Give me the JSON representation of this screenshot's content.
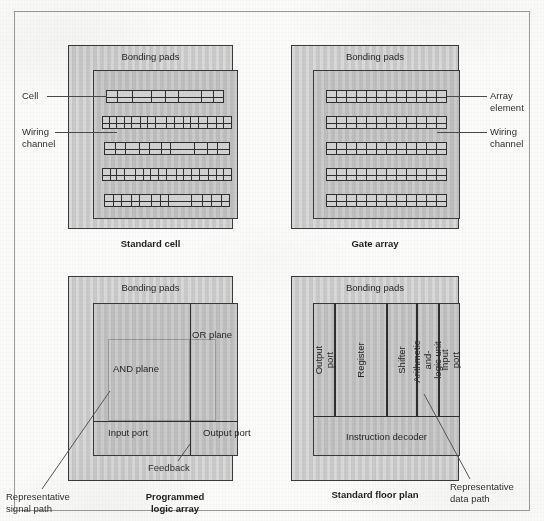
{
  "figure": {
    "panels": [
      {
        "id": "standard-cell",
        "caption": "Standard cell",
        "bonding_pads_label": "Bonding pads",
        "callouts": [
          {
            "name": "cell",
            "text": "Cell"
          },
          {
            "name": "wiring-channel",
            "text": "Wiring\nchannel"
          }
        ],
        "rows": [
          {
            "cells": [
              9,
              13,
              16,
              12,
              11,
              20,
              10,
              8
            ]
          },
          {
            "cells": [
              7,
              7,
              8,
              7,
              9,
              7,
              8,
              12,
              8,
              9,
              7,
              8,
              10,
              9,
              7,
              8
            ]
          },
          {
            "cells": [
              11,
              9,
              14,
              10,
              12,
              9,
              24,
              13,
              10,
              12
            ]
          },
          {
            "cells": [
              8,
              7,
              8,
              12,
              9,
              7,
              8,
              9,
              11,
              7,
              8,
              9,
              10,
              8,
              7,
              9
            ]
          },
          {
            "cells": [
              9,
              8,
              10,
              8,
              12,
              9,
              8,
              24,
              11,
              9,
              10,
              8
            ]
          }
        ]
      },
      {
        "id": "gate-array",
        "caption": "Gate array",
        "bonding_pads_label": "Bonding pads",
        "callouts": [
          {
            "name": "array-element",
            "text": "Array\nelement"
          },
          {
            "name": "wiring-channel",
            "text": "Wiring\nchannel"
          }
        ],
        "rows": [
          {
            "cells": 12
          },
          {
            "cells": 12
          },
          {
            "cells": 12
          },
          {
            "cells": 12
          },
          {
            "cells": 12
          }
        ]
      },
      {
        "id": "programmed-logic-array",
        "caption": "Programmed\nlogic array",
        "bonding_pads_label": "Bonding pads",
        "blocks": [
          {
            "name": "and-plane",
            "text": "AND plane"
          },
          {
            "name": "or-plane",
            "text": "OR plane"
          },
          {
            "name": "input-port",
            "text": "Input\nport"
          },
          {
            "name": "output-port",
            "text": "Output\nport"
          }
        ],
        "callouts": [
          {
            "name": "feedback",
            "text": "Feedback"
          },
          {
            "name": "representative-signal-path",
            "text": "Representative\nsignal path"
          }
        ]
      },
      {
        "id": "standard-floor-plan",
        "caption": "Standard floor plan",
        "bonding_pads_label": "Bonding pads",
        "columns": [
          {
            "name": "output-port",
            "text": "Output port"
          },
          {
            "name": "register",
            "text": "Register"
          },
          {
            "name": "shifter",
            "text": "Shifter"
          },
          {
            "name": "arithmetic-and-logic-unit",
            "text": "Arithmetic-and-\nlogic unit"
          },
          {
            "name": "input-port",
            "text": "Input port"
          }
        ],
        "decoder": {
          "name": "instruction-decoder",
          "text": "Instruction decoder"
        },
        "callouts": [
          {
            "name": "representative-data-path",
            "text": "Representative\ndata path"
          }
        ]
      }
    ],
    "colors": {
      "chip_fill": "#c9c9c9",
      "core_fill": "#bdbdbd",
      "cell_fill": "#d2d2d2",
      "line": "#2e2e2e",
      "leader": "#4a4a4a",
      "frame": "#9a9a9a",
      "paper": "#fbfbfa"
    }
  }
}
